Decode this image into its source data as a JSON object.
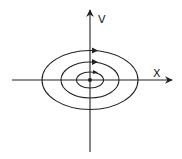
{
  "diagram": {
    "type": "phase-portrait",
    "axes": {
      "x_label": "X",
      "y_label": "V"
    },
    "center": {
      "x": 90,
      "y": 80
    },
    "orbits": [
      {
        "name": "inner",
        "rx": 13.5,
        "ry": 8
      },
      {
        "name": "middle",
        "rx": 29,
        "ry": 18
      },
      {
        "name": "outer",
        "rx": 48,
        "ry": 29.5
      }
    ],
    "direction": "clockwise",
    "colors": {
      "stroke": "#222222",
      "background": "#ffffff"
    }
  }
}
